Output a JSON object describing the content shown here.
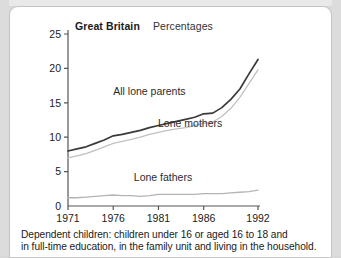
{
  "header": {
    "region": "Great Britain",
    "units": "Percentages"
  },
  "caption": {
    "line1": "Dependent children: children under 16 or aged 16 to 18 and",
    "line2": "in full-time education, in the family unit and living in the household."
  },
  "colors": {
    "all_lone_parents": "#3a3a3a",
    "lone_mothers": "#c0c0c0",
    "lone_fathers": "#b4b4b4",
    "axis": "#555555",
    "card_background": "#ffffff",
    "page_background": "#d8d8d8"
  },
  "chart_data": {
    "type": "line",
    "title": "Great Britain",
    "subtitle": "Percentages",
    "xlabel": "",
    "ylabel": "",
    "xlim": [
      1971,
      1992
    ],
    "ylim": [
      0,
      25
    ],
    "yticks": [
      0,
      5,
      10,
      15,
      20,
      25
    ],
    "ytick_labels": [
      "0",
      "5",
      "10",
      "15",
      "20",
      "25"
    ],
    "xticks": [
      1971,
      1976,
      1981,
      1986,
      1992
    ],
    "xtick_labels": [
      "1971",
      "1976",
      "1981",
      "1986",
      "1992"
    ],
    "grid": false,
    "legend": "inline-annotations",
    "x": [
      1971,
      1972,
      1973,
      1974,
      1975,
      1976,
      1977,
      1978,
      1979,
      1980,
      1981,
      1982,
      1983,
      1984,
      1985,
      1986,
      1987,
      1988,
      1989,
      1990,
      1991,
      1992
    ],
    "series": [
      {
        "name": "All lone parents",
        "color": "#3a3a3a",
        "values": [
          8.0,
          8.3,
          8.6,
          9.1,
          9.6,
          10.2,
          10.4,
          10.7,
          11.0,
          11.4,
          11.7,
          12.0,
          12.3,
          12.6,
          12.9,
          13.4,
          13.5,
          14.3,
          15.5,
          17.0,
          19.2,
          21.3
        ]
      },
      {
        "name": "Lone mothers",
        "color": "#c0c0c0",
        "values": [
          7.0,
          7.3,
          7.6,
          8.1,
          8.6,
          9.1,
          9.4,
          9.7,
          10.0,
          10.4,
          10.7,
          11.0,
          11.2,
          11.4,
          11.7,
          12.0,
          12.2,
          13.0,
          14.2,
          15.8,
          17.8,
          19.8
        ]
      },
      {
        "name": "Lone fathers",
        "color": "#b4b4b4",
        "values": [
          1.2,
          1.2,
          1.3,
          1.4,
          1.5,
          1.6,
          1.5,
          1.5,
          1.4,
          1.5,
          1.7,
          1.7,
          1.7,
          1.7,
          1.7,
          1.8,
          1.8,
          1.8,
          1.9,
          2.0,
          2.1,
          2.3
        ]
      }
    ],
    "annotations": [
      {
        "text": "All lone parents",
        "x": 1980.0,
        "y": 16.2
      },
      {
        "text": "Lone mothers",
        "x": 1984.5,
        "y": 11.5
      },
      {
        "text": "Lone fathers",
        "x": 1981.5,
        "y": 3.6
      }
    ]
  }
}
